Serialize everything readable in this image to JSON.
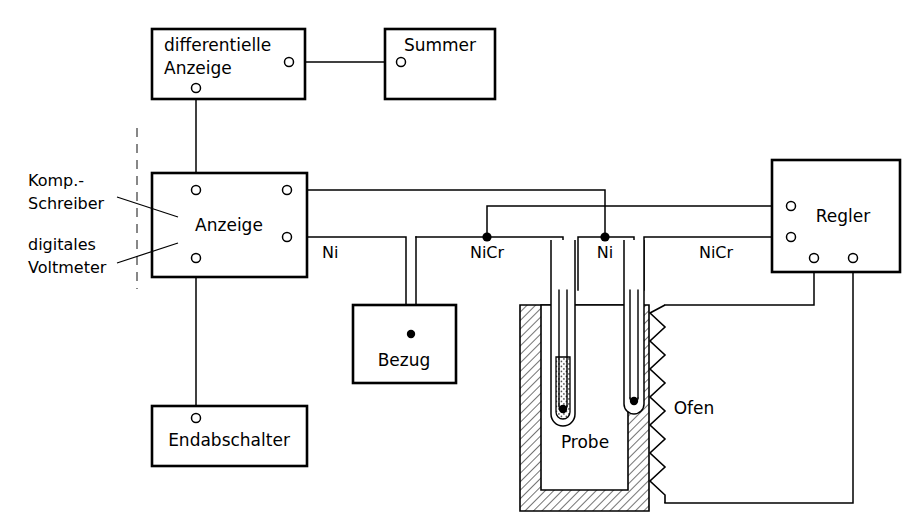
{
  "diagram": {
    "language": "de"
  },
  "boxes": {
    "differential_display": {
      "label_line1": "differentielle",
      "label_line2": "Anzeige"
    },
    "buzzer": {
      "label": "Summer"
    },
    "display": {
      "label": "Anzeige"
    },
    "controller": {
      "label": "Regler"
    },
    "reference": {
      "label": "Bezug"
    },
    "limit_switch": {
      "label": "Endabschalter"
    }
  },
  "annotations": {
    "komp_schreiber_line1": "Komp.-",
    "komp_schreiber_line2": "Schreiber",
    "digital_voltmeter_line1": "digitales",
    "digital_voltmeter_line2": "Voltmeter"
  },
  "wire_labels": {
    "ni_left": "Ni",
    "nicr_middle": "NiCr",
    "ni_right": "Ni",
    "nicr_right": "NiCr"
  },
  "furnace": {
    "sample_label": "Probe",
    "furnace_label": "Ofen"
  },
  "colors": {
    "line": "#000000",
    "background": "#ffffff",
    "hatch": "#000000",
    "dashed_divider": "#555555"
  }
}
